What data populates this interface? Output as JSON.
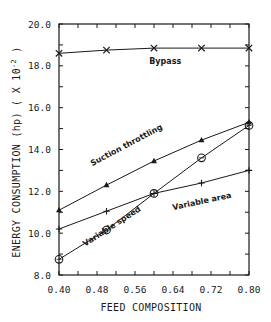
{
  "chart_data": {
    "type": "line",
    "title": "",
    "xlabel": "FEED COMPOSITION",
    "ylabel": "ENERGY CONSUMPTION (hp) ( X 10",
    "ylabel_exponent": "-2",
    "ylabel_suffix": " )",
    "xlim": [
      0.4,
      0.8
    ],
    "ylim": [
      8.0,
      20.0
    ],
    "x_ticks": [
      "0.40",
      "0.48",
      "0.56",
      "0.64",
      "0.72",
      "0.80"
    ],
    "y_ticks": [
      "8.0",
      "10.0",
      "12.0",
      "14.0",
      "16.0",
      "18.0",
      "20.0"
    ],
    "grid": false,
    "legend": "inline labels",
    "x": [
      0.4,
      0.5,
      0.6,
      0.7,
      0.8
    ],
    "series": [
      {
        "name": "Bypass",
        "marker": "x",
        "values": [
          18.6,
          18.75,
          18.85,
          18.85,
          18.85
        ],
        "label_pos": [
          0.59,
          18.1
        ],
        "label_angle": 0
      },
      {
        "name": "Suction throttling",
        "marker": "triangle",
        "values": [
          11.1,
          12.3,
          13.45,
          14.45,
          15.3
        ],
        "label_pos": [
          0.47,
          13.2
        ],
        "label_angle": -28
      },
      {
        "name": "Variable area",
        "marker": "plus",
        "values": [
          10.2,
          11.05,
          11.9,
          12.4,
          13.0
        ],
        "label_pos": [
          0.64,
          11.1
        ],
        "label_angle": -12
      },
      {
        "name": "Variable speed",
        "marker": "circle",
        "values": [
          8.75,
          10.15,
          11.9,
          13.6,
          15.15
        ],
        "label_pos": [
          0.455,
          9.35
        ],
        "label_angle": -33
      }
    ]
  },
  "colors": {
    "ink": "#1a1a1a",
    "background": "#ffffff"
  }
}
